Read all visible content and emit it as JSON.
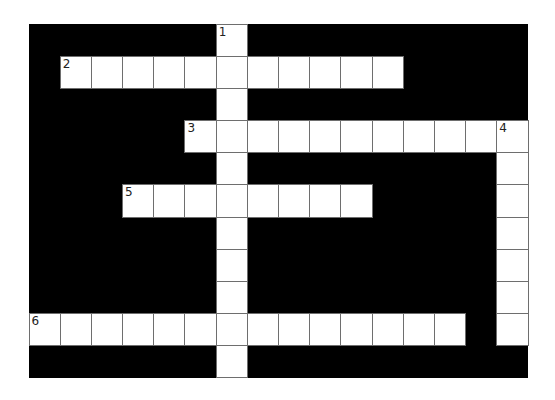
{
  "puzzle": {
    "rows": 11,
    "cols": 16,
    "colors": {
      "block": "#000000",
      "cell": "#ffffff",
      "gridline": "#6e6e6e"
    },
    "clues": [
      {
        "number": "1",
        "direction": "down",
        "row": 0,
        "col": 0,
        "length": 11,
        "col_index": 6
      },
      {
        "number": "2",
        "direction": "across",
        "row": 1,
        "col": 1,
        "length": 11
      },
      {
        "number": "3",
        "direction": "across",
        "row": 3,
        "col": 5,
        "length": 11
      },
      {
        "number": "4",
        "direction": "down",
        "row": 3,
        "col": 15,
        "length": 7
      },
      {
        "number": "5",
        "direction": "across",
        "row": 5,
        "col": 3,
        "length": 8
      },
      {
        "number": "6",
        "direction": "across",
        "row": 9,
        "col": 0,
        "length": 14
      }
    ]
  }
}
